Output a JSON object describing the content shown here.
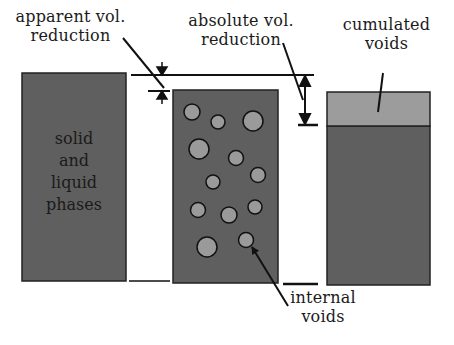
{
  "labels": {
    "apparent": [
      "apparent vol.",
      "reduction"
    ],
    "absolute": [
      "absolute vol.",
      "reduction"
    ],
    "cumulated": [
      "cumulated",
      "voids"
    ],
    "solid_liquid": [
      "solid",
      "and",
      "liquid",
      "phases"
    ],
    "internal": [
      "internal",
      "voids"
    ]
  },
  "colors": {
    "solid_fill": "#5f5f5f",
    "void_fill": "#9a9a9a",
    "cumulated_fill": "#9c9c9c",
    "line": "#111111"
  }
}
